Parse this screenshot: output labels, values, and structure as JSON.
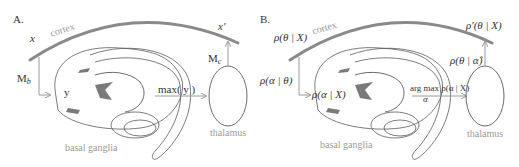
{
  "colors": {
    "cortex_stroke": "#8a8a8a",
    "outline": "#5a5a5a",
    "arrow": "#9a9a9a",
    "label_gray": "#9a9a9a",
    "fill_dark": "#7a7a7a"
  },
  "panel_a": {
    "tag": "A.",
    "cortex_label": "cortex",
    "input_label": "x",
    "output_label": "x′",
    "mb_label": "M",
    "mb_sub": "b",
    "mc_label": "M",
    "mc_sub": "c",
    "y_label": "y",
    "max_label": "max( y )",
    "basal_ganglia_label": "basal ganglia",
    "thalamus_label": "thalamus"
  },
  "panel_b": {
    "tag": "B.",
    "cortex_label": "cortex",
    "input_label": "ρ(θ | X)",
    "output_label": "ρ′(θ | X)",
    "left_arrow_label": "ρ(α | θ)",
    "right_arrow_label": "ρ(θ | α̂)",
    "bg_label": "ρ(α | X)",
    "argmax_top": "arg max ρ(α | X)",
    "argmax_sub": "α",
    "basal_ganglia_label": "basal ganglia",
    "thalamus_label": "thalamus"
  }
}
